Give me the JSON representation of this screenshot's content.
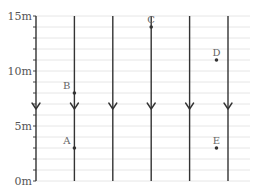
{
  "diagram": {
    "type": "uniform-field-diagram",
    "field_direction": "down",
    "y_axis": {
      "ticks": [
        {
          "value": 15,
          "label": "15m"
        },
        {
          "value": 10,
          "label": "10m"
        },
        {
          "value": 5,
          "label": "5m"
        },
        {
          "value": 0,
          "label": "0m"
        }
      ],
      "min": 0,
      "max": 15,
      "minor_step": 1
    },
    "field_lines_count": 6,
    "points": [
      {
        "label": "A",
        "column": 1,
        "height_m": 3
      },
      {
        "label": "B",
        "column": 1,
        "height_m": 8
      },
      {
        "label": "C",
        "column": 3,
        "height_m": 14
      },
      {
        "label": "D",
        "column": 4.7,
        "height_m": 11
      },
      {
        "label": "E",
        "column": 4.7,
        "height_m": 3
      }
    ],
    "colors": {
      "grid": "#e6e6e6",
      "field_line": "#333333",
      "axis": "#444444",
      "text": "#555555",
      "point": "#333333"
    }
  }
}
